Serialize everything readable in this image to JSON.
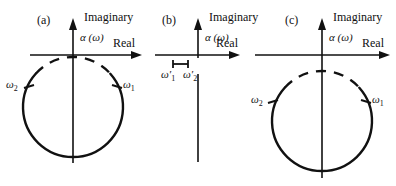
{
  "figure": {
    "background_color": "#ffffff",
    "stroke_color": "#111111",
    "panels": [
      {
        "id": "a",
        "panel_label": "(a)",
        "axis_labels": {
          "imaginary": "Imaginary",
          "real": "Real"
        },
        "function_label": "α (ω)",
        "markers": [
          {
            "name": "omega-2",
            "label": "ω",
            "subscript": "2",
            "side": "left"
          },
          {
            "name": "omega-1",
            "label": "ω",
            "subscript": "1",
            "side": "right"
          }
        ],
        "geometry": {
          "origin_x": 73,
          "origin_y": 55,
          "circle_center_x": 73,
          "circle_center_y": 107,
          "circle_radius": 50,
          "solid_arc_description": "lower ~3/4 of circle drawn solid",
          "dashed_arc_description": "upper arc drawn dashed, tangent to real axis",
          "real_axis_from_x": 30,
          "real_axis_to_x": 140,
          "imag_axis_from_y": 20,
          "imag_axis_to_y": 163
        }
      },
      {
        "id": "b",
        "panel_label": "(b)",
        "axis_labels": {
          "imaginary": "Imaginary",
          "real": "Real"
        },
        "function_label": "α (ω)",
        "markers": [
          {
            "name": "omega-1-prime",
            "label": "ω′",
            "subscript": "1",
            "side": "left"
          },
          {
            "name": "omega-2-prime",
            "label": "ω′",
            "subscript": "2",
            "side": "right"
          }
        ],
        "geometry": {
          "origin_x": 198,
          "origin_y": 55,
          "has_circle": false,
          "bracket_from_x": 173,
          "bracket_to_x": 188,
          "bracket_y": 64,
          "real_axis_from_x": 155,
          "real_axis_to_x": 243,
          "imag_axis_from_y": 20,
          "imag_axis_to_y": 162,
          "imag_axis_gap_from_y": 58,
          "imag_axis_gap_to_y": 74
        }
      },
      {
        "id": "c",
        "panel_label": "(c)",
        "axis_labels": {
          "imaginary": "Imaginary",
          "real": "Real"
        },
        "function_label": "α (ω)",
        "markers": [
          {
            "name": "omega-2",
            "label": "ω",
            "subscript": "2",
            "side": "left"
          },
          {
            "name": "omega-1",
            "label": "ω",
            "subscript": "1",
            "side": "right"
          }
        ],
        "geometry": {
          "origin_x": 322,
          "origin_y": 55,
          "circle_center_x": 322,
          "circle_center_y": 121,
          "circle_radius": 50,
          "solid_arc_description": "lower ~3/4 of circle drawn solid",
          "dashed_arc_description": "upper arc drawn dashed, below the real axis",
          "real_axis_from_x": 255,
          "real_axis_to_x": 390,
          "imag_axis_from_y": 20,
          "imag_axis_to_y": 178
        }
      }
    ]
  }
}
